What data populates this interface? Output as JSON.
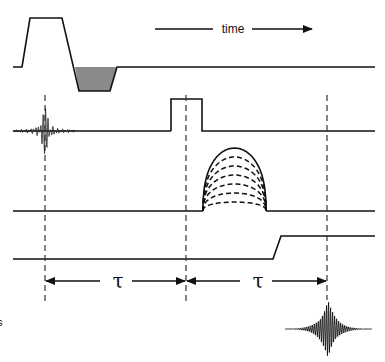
{
  "diagram": {
    "time_label": "time",
    "interval_labels": [
      "τ",
      "τ"
    ],
    "edge_label": "s",
    "rows": [
      {
        "id": "gradient-slice",
        "description": "slice-select gradient with shaded rephasing lobe"
      },
      {
        "id": "rf",
        "description": "RF excitation sinc pulse and 180° refocusing pulse"
      },
      {
        "id": "gradient-phase",
        "description": "phase-encoding gradient table with stepped amplitudes"
      },
      {
        "id": "gradient-readout",
        "description": "readout gradient step"
      },
      {
        "id": "signal",
        "description": "spin echo signal"
      }
    ],
    "phase_encode_steps": 7,
    "colors": {
      "line": "#111111",
      "shade": "#8a8a8a",
      "background": "#ffffff"
    }
  }
}
